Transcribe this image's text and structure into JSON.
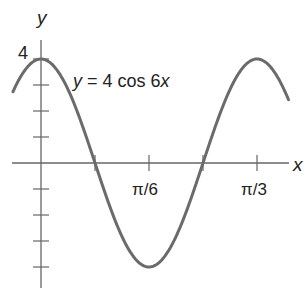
{
  "chart_data": {
    "type": "line",
    "title": "",
    "annotation": "y = 4 cos 6x",
    "annotation_parts": {
      "y": "y",
      "eq": " = 4 cos 6",
      "x": "x"
    },
    "xlabel": "x",
    "ylabel": "y",
    "x_tick_labels": [
      "π/6",
      "π/3"
    ],
    "x_tick_values": [
      0.5236,
      1.0472
    ],
    "y_tick_labels": [
      "4"
    ],
    "y_tick_values": [
      -4,
      -3,
      -2,
      -1,
      1,
      2,
      3,
      4
    ],
    "xlim": [
      -0.14,
      1.2
    ],
    "ylim": [
      -4.4,
      4.6
    ],
    "grid": false,
    "series": [
      {
        "name": "y = 4 cos 6x",
        "function": "4*cos(6*x)",
        "x_range": [
          -0.136,
          1.2
        ],
        "key_points": [
          {
            "x": 0,
            "y": 4
          },
          {
            "x": 0.2618,
            "y": 0
          },
          {
            "x": 0.5236,
            "y": -4
          },
          {
            "x": 0.7854,
            "y": 0
          },
          {
            "x": 1.0472,
            "y": 4
          }
        ],
        "color": "#6b6b6b"
      }
    ]
  }
}
